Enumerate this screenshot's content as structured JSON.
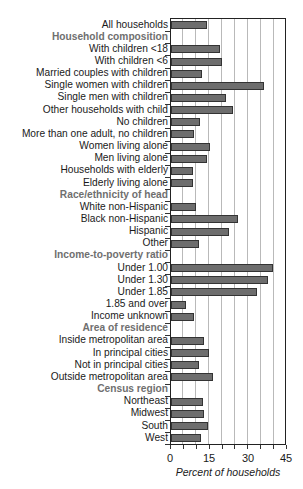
{
  "chart_data": {
    "type": "bar",
    "orientation": "horizontal",
    "title": "",
    "xlabel": "Percent of households",
    "ylabel": "",
    "xlim": [
      0,
      45
    ],
    "x_ticks": [
      0,
      15,
      30,
      45
    ],
    "grid": {
      "vertical": true,
      "step": 5
    },
    "legend": null,
    "rows": [
      {
        "label": "All households",
        "value": 14.5,
        "header": false
      },
      {
        "label": "Household composition",
        "value": null,
        "header": true
      },
      {
        "label": "With children <18",
        "value": 19.3,
        "header": false
      },
      {
        "label": "With children <6",
        "value": 20.3,
        "header": false
      },
      {
        "label": "Married couples with children",
        "value": 12.6,
        "header": false
      },
      {
        "label": "Single women with children",
        "value": 36.4,
        "header": false
      },
      {
        "label": "Single men with children",
        "value": 21.9,
        "header": false
      },
      {
        "label": "Other households with child",
        "value": 24.6,
        "header": false
      },
      {
        "label": "No children",
        "value": 11.7,
        "header": false
      },
      {
        "label": "More than one adult, no children",
        "value": 9.5,
        "header": false
      },
      {
        "label": "Women living alone",
        "value": 15.6,
        "header": false
      },
      {
        "label": "Men living alone",
        "value": 14.2,
        "header": false
      },
      {
        "label": "Households with elderly",
        "value": 8.9,
        "header": false
      },
      {
        "label": "Elderly living alone",
        "value": 9.1,
        "header": false
      },
      {
        "label": "Race/ethnicity of head",
        "value": null,
        "header": true
      },
      {
        "label": "White non-Hispanic",
        "value": 10.1,
        "header": false
      },
      {
        "label": "Black non-Hispanic",
        "value": 26.2,
        "header": false
      },
      {
        "label": "Hispanic",
        "value": 22.7,
        "header": false
      },
      {
        "label": "Other",
        "value": 11.4,
        "header": false
      },
      {
        "label": "Income-to-poverty ratio",
        "value": null,
        "header": true
      },
      {
        "label": "Under 1.00",
        "value": 40.1,
        "header": false
      },
      {
        "label": "Under 1.30",
        "value": 37.9,
        "header": false
      },
      {
        "label": "Under 1.85",
        "value": 33.9,
        "header": false
      },
      {
        "label": "1.85 and over",
        "value": 6.1,
        "header": false
      },
      {
        "label": "Income unknown",
        "value": 9.5,
        "header": false
      },
      {
        "label": "Area of residence",
        "value": null,
        "header": true
      },
      {
        "label": "Inside metropolitan area",
        "value": 13.0,
        "header": false
      },
      {
        "label": "In principal cities",
        "value": 15.3,
        "header": false
      },
      {
        "label": "Not in principal cities",
        "value": 11.4,
        "header": false
      },
      {
        "label": "Outside metropolitan area",
        "value": 16.5,
        "header": false
      },
      {
        "label": "Census region",
        "value": null,
        "header": true
      },
      {
        "label": "Northeast",
        "value": 12.8,
        "header": false
      },
      {
        "label": "Midwest",
        "value": 13.3,
        "header": false
      },
      {
        "label": "South",
        "value": 14.9,
        "header": false
      },
      {
        "label": "West",
        "value": 12.2,
        "header": false
      }
    ]
  },
  "colors": {
    "bar_fill": "#6d6d6d",
    "bar_border": "#333333",
    "section_header": "#6f6f6f",
    "gridline": "#b9b9b9",
    "axis": "#222222"
  },
  "axis": {
    "x_label": "Percent of households",
    "tick_labels": [
      "0",
      "15",
      "30",
      "45"
    ]
  }
}
